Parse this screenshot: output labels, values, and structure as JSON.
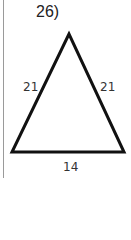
{
  "problem": {
    "number_label": "26)"
  },
  "triangle": {
    "type": "isosceles",
    "side_left": "21",
    "side_right": "21",
    "base": "14",
    "stroke_color": "#111111"
  }
}
